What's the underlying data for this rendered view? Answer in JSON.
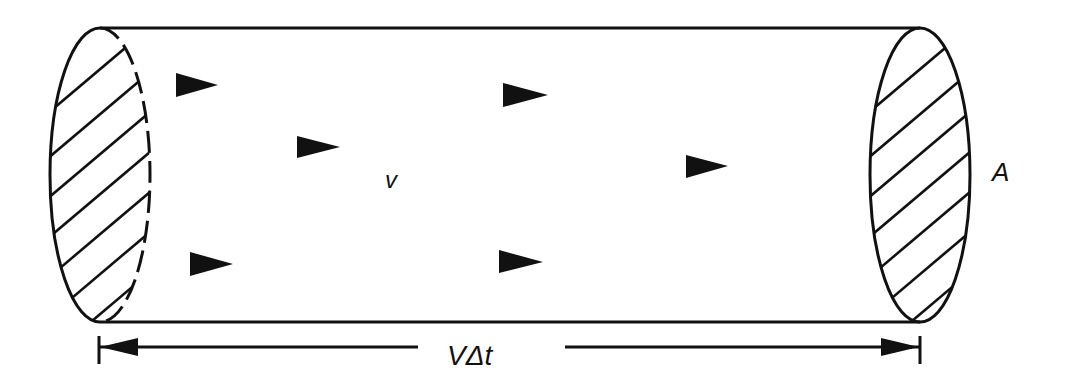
{
  "diagram": {
    "labels": {
      "velocity": "v",
      "area": "A",
      "length": "VΔt"
    },
    "colors": {
      "stroke": "#111111",
      "background": "#ffffff"
    },
    "particles": [
      {
        "x": 176,
        "y": 85
      },
      {
        "x": 503,
        "y": 95
      },
      {
        "x": 297,
        "y": 147
      },
      {
        "x": 686,
        "y": 166
      },
      {
        "x": 190,
        "y": 264
      },
      {
        "x": 499,
        "y": 262
      }
    ]
  }
}
